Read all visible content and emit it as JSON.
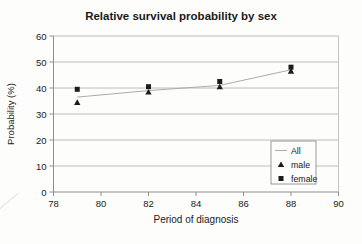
{
  "chart_data": {
    "type": "line",
    "title": "Relative survival probability by sex",
    "xlabel": "Period of diagnosis",
    "ylabel": "Probability (%)",
    "xlim": [
      78,
      90
    ],
    "ylim": [
      0,
      60
    ],
    "xticks": [
      78,
      80,
      82,
      84,
      86,
      88,
      90
    ],
    "yticks": [
      0,
      10,
      20,
      30,
      40,
      50,
      60
    ],
    "grid": "horizontal",
    "legend_position": "inside-right",
    "x": [
      79,
      82,
      85,
      88
    ],
    "series": [
      {
        "name": "All",
        "draw": "line",
        "marker": "none",
        "color": "#ababab",
        "values": [
          36.5,
          39.0,
          41.0,
          47.0
        ]
      },
      {
        "name": "male",
        "draw": "scatter",
        "marker": "triangle",
        "color": "#1c1c1c",
        "values": [
          34.5,
          38.5,
          40.5,
          46.5
        ]
      },
      {
        "name": "female",
        "draw": "scatter",
        "marker": "square",
        "color": "#1c1c1c",
        "values": [
          39.5,
          40.5,
          42.5,
          48.0
        ]
      }
    ],
    "colors": {
      "title_text": "#1a1a1a",
      "axis_text": "#222222",
      "gridline": "#bcbcbc",
      "axis_line": "#8f8f8f",
      "plot_border": "#c4c4c4",
      "legend_border": "#9a9a9a",
      "legend_background": "#fdfdfb",
      "background": "#fdfdfb"
    }
  }
}
